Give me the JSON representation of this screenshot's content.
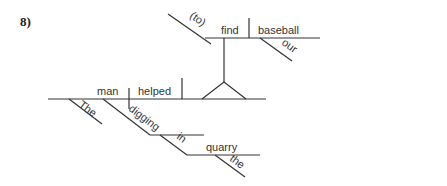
{
  "problem_number": "8)",
  "diagram": {
    "type": "sentence-diagram",
    "words": {
      "subject": "man",
      "subject_modifier": "The",
      "verb": "helped",
      "participle": "digging",
      "preposition": "in",
      "prep_object": "quarry",
      "prep_object_modifier": "the",
      "infinitive_marker": "(to)",
      "infinitive_verb": "find",
      "infinitive_object": "baseball",
      "infinitive_object_modifier": "our"
    }
  }
}
